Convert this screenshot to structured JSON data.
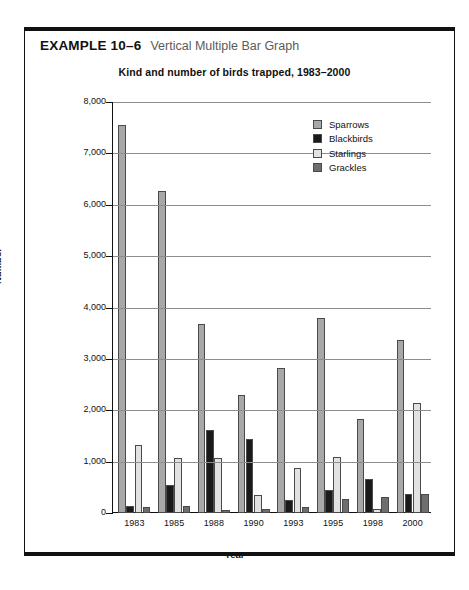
{
  "caption": {
    "example_label": "EXAMPLE 10–6",
    "example_title": "Vertical Multiple Bar Graph"
  },
  "chart_data": {
    "type": "bar",
    "title": "Kind and number of birds trapped, 1983–2000",
    "xlabel": "Year",
    "ylabel": "Number",
    "ylim": [
      0,
      8000
    ],
    "ytick_labels": [
      "0",
      "1,000",
      "2,000",
      "3,000",
      "4,000",
      "5,000",
      "6,000",
      "7,000",
      "8,000"
    ],
    "ytick_values": [
      0,
      1000,
      2000,
      3000,
      4000,
      5000,
      6000,
      7000,
      8000
    ],
    "grid": true,
    "legend_position": "upper-right-inside",
    "categories": [
      "1983",
      "1985",
      "1988",
      "1990",
      "1993",
      "1995",
      "1998",
      "2000"
    ],
    "series": [
      {
        "name": "Sparrows",
        "color": "#a8a8a8",
        "values": [
          7560,
          6270,
          3670,
          2300,
          2820,
          3800,
          1830,
          3370
        ]
      },
      {
        "name": "Blackbirds",
        "color": "#1a1a1a",
        "values": [
          130,
          540,
          1620,
          1450,
          250,
          440,
          660,
          370
        ]
      },
      {
        "name": "Starlings",
        "color": "#e2e2e2",
        "values": [
          1330,
          1070,
          1080,
          350,
          880,
          1090,
          80,
          2150
        ]
      },
      {
        "name": "Grackles",
        "color": "#6e6e6e",
        "values": [
          120,
          130,
          60,
          80,
          120,
          280,
          310,
          370
        ]
      }
    ]
  }
}
